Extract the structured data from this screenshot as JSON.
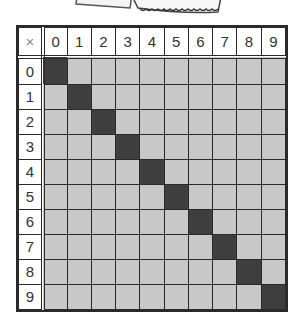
{
  "header": {
    "corner_symbol": "×",
    "columns": [
      "0",
      "1",
      "2",
      "3",
      "4",
      "5",
      "6",
      "7",
      "8",
      "9"
    ]
  },
  "rows": [
    "0",
    "1",
    "2",
    "3",
    "4",
    "5",
    "6",
    "7",
    "8",
    "9"
  ],
  "colors": {
    "cell_fill": "#c8c8c8",
    "diagonal_fill": "#3e3e3e",
    "grid_line": "#2a2a2a",
    "header_bg": "#ffffff"
  },
  "decoration": {
    "stamp": "torn postage-stamp graphic (partially cropped)"
  }
}
